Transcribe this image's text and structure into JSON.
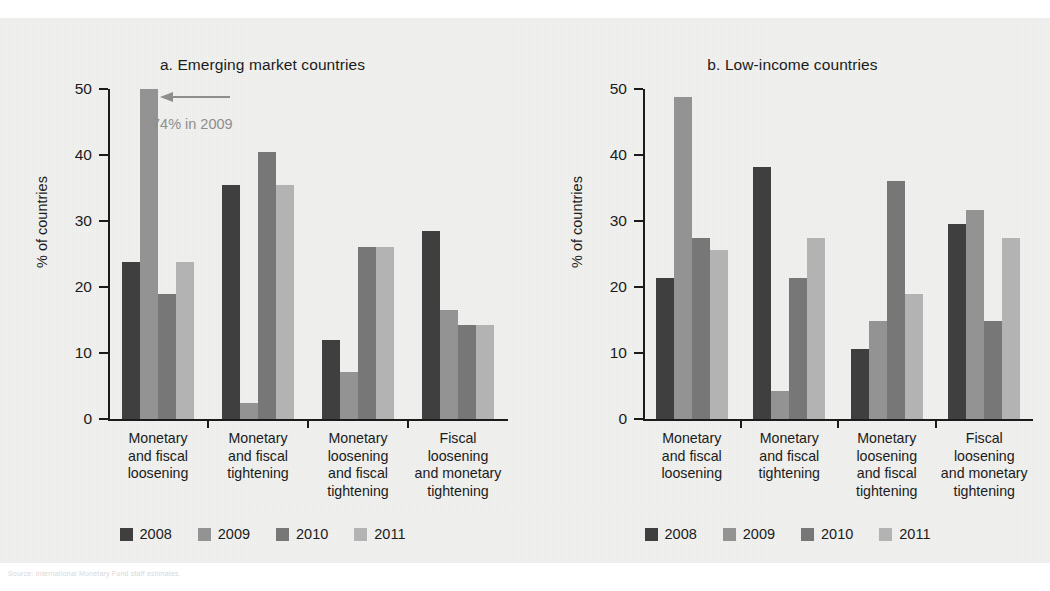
{
  "figure": {
    "y_axis_title": "% of countries",
    "y_ticks": [
      "0",
      "10",
      "20",
      "30",
      "40",
      "50"
    ],
    "source_note": "Source: International Monetary Fund staff estimates."
  },
  "legend": {
    "items": [
      {
        "label": "2008",
        "color": "#3f3f3f"
      },
      {
        "label": "2009",
        "color": "#939393"
      },
      {
        "label": "2010",
        "color": "#777777"
      },
      {
        "label": "2011",
        "color": "#b3b3b3"
      }
    ]
  },
  "annotation": {
    "text": "74% in 2009",
    "color": "#8e8e8e"
  },
  "chart_data": [
    {
      "type": "bar",
      "id": "panel-a",
      "title": "a.  Emerging market countries",
      "xlabel": "",
      "ylabel": "% of countries",
      "ylim": [
        0,
        50
      ],
      "ytick_values": [
        0,
        10,
        20,
        30,
        40,
        50
      ],
      "grid": false,
      "legend_position": "bottom",
      "annotations": [
        {
          "text": "74% in 2009",
          "refers_to": "2009 bar of Monetary and fiscal loosening (clipped at axis maximum)",
          "true_value": 74
        }
      ],
      "categories": [
        "Monetary\nand fiscal\nloosening",
        "Monetary\nand fiscal\ntightening",
        "Monetary\nloosening\nand fiscal\ntightening",
        "Fiscal\nloosening\nand monetary\ntightening"
      ],
      "series": [
        {
          "name": "2008",
          "color": "#3f3f3f",
          "values": [
            23.8,
            35.5,
            11.9,
            28.5
          ]
        },
        {
          "name": "2009",
          "color": "#939393",
          "values": [
            74,
            2.4,
            7.1,
            16.5
          ]
        },
        {
          "name": "2010",
          "color": "#777777",
          "values": [
            19.0,
            40.4,
            26.1,
            14.2
          ]
        },
        {
          "name": "2011",
          "color": "#b3b3b3",
          "values": [
            23.8,
            35.5,
            26.1,
            14.2
          ]
        }
      ]
    },
    {
      "type": "bar",
      "id": "panel-b",
      "title": "b.  Low-income countries",
      "xlabel": "",
      "ylabel": "% of countries",
      "ylim": [
        0,
        50
      ],
      "ytick_values": [
        0,
        10,
        20,
        30,
        40,
        50
      ],
      "grid": false,
      "legend_position": "bottom",
      "annotations": [],
      "categories": [
        "Monetary\nand fiscal\nloosening",
        "Monetary\nand fiscal\ntightening",
        "Monetary\nloosening\nand fiscal\ntightening",
        "Fiscal\nloosening\nand monetary\ntightening"
      ],
      "series": [
        {
          "name": "2008",
          "color": "#3f3f3f",
          "values": [
            21.3,
            38.2,
            10.6,
            29.6
          ]
        },
        {
          "name": "2009",
          "color": "#939393",
          "values": [
            48.8,
            4.2,
            14.8,
            31.7
          ]
        },
        {
          "name": "2010",
          "color": "#777777",
          "values": [
            27.5,
            21.3,
            36.0,
            14.8
          ]
        },
        {
          "name": "2011",
          "color": "#b3b3b3",
          "values": [
            25.6,
            27.5,
            19.0,
            27.5
          ]
        }
      ]
    }
  ]
}
